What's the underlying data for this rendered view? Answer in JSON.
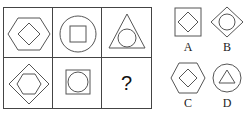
{
  "puzzle": {
    "question_mark": "?",
    "grid": [
      {
        "outer": "hexagon",
        "inner": "diamond"
      },
      {
        "outer": "circle",
        "inner": "square"
      },
      {
        "outer": "triangle",
        "inner": "circle"
      },
      {
        "outer": "diamond",
        "inner": "hexagon"
      },
      {
        "outer": "square",
        "inner": "circle"
      },
      {
        "outer": "unknown",
        "inner": "unknown"
      }
    ],
    "options": [
      {
        "label": "A",
        "outer": "square",
        "inner": "diamond"
      },
      {
        "label": "B",
        "outer": "diamond",
        "inner": "circle"
      },
      {
        "label": "C",
        "outer": "hexagon",
        "inner": "diamond"
      },
      {
        "label": "D",
        "outer": "circle",
        "inner": "triangle"
      }
    ],
    "stroke_color": "#555555"
  }
}
